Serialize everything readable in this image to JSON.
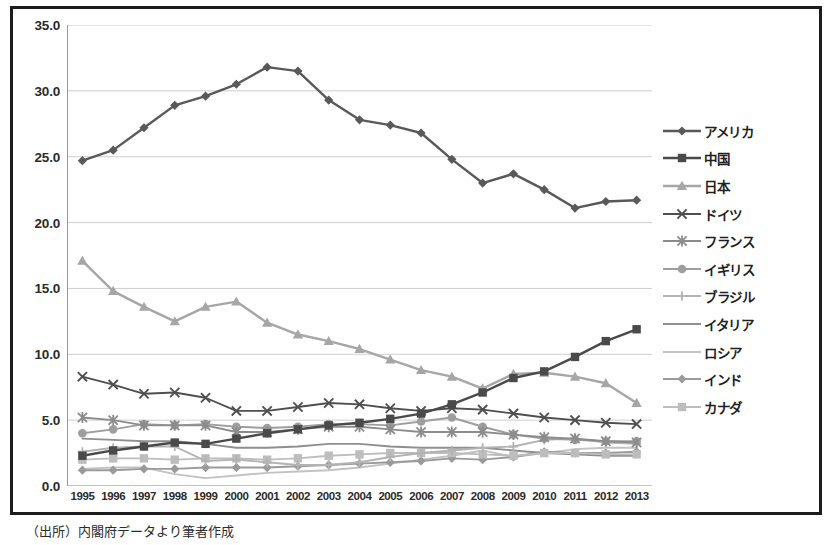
{
  "figure": {
    "source_caption": "（出所）内閣府データより筆者作成",
    "frame_color": "#1c1c1c"
  },
  "chart_data": {
    "type": "line",
    "title": "",
    "subtitle": "",
    "xlabel": "",
    "ylabel": "",
    "grid": true,
    "legend_position": "right",
    "ylim": [
      0.0,
      35.0
    ],
    "ytick_labels": [
      "35.0",
      "30.0",
      "25.0",
      "20.0",
      "15.0",
      "10.0",
      "5.0",
      "0.0"
    ],
    "yticks": [
      35.0,
      30.0,
      25.0,
      20.0,
      15.0,
      10.0,
      5.0,
      0.0
    ],
    "categories": [
      "1995",
      "1996",
      "1997",
      "1998",
      "1999",
      "2000",
      "2001",
      "2002",
      "2003",
      "2004",
      "2005",
      "2006",
      "2007",
      "2008",
      "2009",
      "2010",
      "2011",
      "2012",
      "2013"
    ],
    "series": [
      {
        "name": "アメリカ",
        "marker": "diamond",
        "color": "#595959",
        "values": [
          24.7,
          25.5,
          27.2,
          28.9,
          29.6,
          30.5,
          31.8,
          31.5,
          29.3,
          27.8,
          27.4,
          26.8,
          24.8,
          23.0,
          23.7,
          22.5,
          21.1,
          21.6,
          21.7
        ]
      },
      {
        "name": "中国",
        "marker": "square",
        "color": "#4a4a4a",
        "values": [
          2.3,
          2.7,
          3.0,
          3.3,
          3.2,
          3.6,
          4.0,
          4.3,
          4.6,
          4.8,
          5.1,
          5.5,
          6.2,
          7.1,
          8.2,
          8.7,
          9.8,
          11.0,
          11.9
        ]
      },
      {
        "name": "日本",
        "marker": "triangle",
        "color": "#a6a6a6",
        "values": [
          17.1,
          14.8,
          13.6,
          12.5,
          13.6,
          14.0,
          12.4,
          11.5,
          11.0,
          10.4,
          9.6,
          8.8,
          8.3,
          7.4,
          8.5,
          8.6,
          8.3,
          7.8,
          6.3
        ]
      },
      {
        "name": "ドイツ",
        "marker": "x",
        "color": "#4f4f4f",
        "values": [
          8.3,
          7.7,
          7.0,
          7.1,
          6.7,
          5.7,
          5.7,
          6.0,
          6.3,
          6.2,
          5.9,
          5.7,
          5.9,
          5.8,
          5.5,
          5.2,
          5.0,
          4.8,
          4.7
        ]
      },
      {
        "name": "フランス",
        "marker": "asterisk",
        "color": "#8c8c8c",
        "values": [
          5.2,
          5.0,
          4.6,
          4.6,
          4.6,
          4.1,
          4.1,
          4.3,
          4.5,
          4.5,
          4.3,
          4.1,
          4.1,
          4.1,
          3.9,
          3.7,
          3.6,
          3.4,
          3.3
        ]
      },
      {
        "name": "イギリス",
        "marker": "circle",
        "color": "#9e9e9e",
        "values": [
          4.0,
          4.3,
          4.7,
          4.6,
          4.7,
          4.5,
          4.4,
          4.5,
          4.7,
          4.7,
          4.6,
          4.9,
          5.2,
          4.5,
          3.9,
          3.6,
          3.5,
          3.4,
          3.4
        ]
      },
      {
        "name": "ブラジル",
        "marker": "plus",
        "color": "#b3b3b3",
        "values": [
          2.6,
          2.9,
          3.0,
          3.0,
          1.9,
          2.0,
          1.8,
          1.6,
          1.6,
          1.8,
          2.2,
          2.5,
          2.7,
          2.9,
          3.0,
          3.5,
          3.6,
          3.3,
          3.2
        ]
      },
      {
        "name": "イタリア",
        "marker": "none",
        "color": "#8f8f8f",
        "values": [
          3.6,
          3.5,
          3.4,
          3.4,
          3.2,
          2.9,
          2.9,
          3.0,
          3.2,
          3.2,
          3.0,
          2.9,
          2.9,
          2.9,
          2.7,
          2.5,
          2.4,
          2.3,
          2.3
        ]
      },
      {
        "name": "ロシア",
        "marker": "none",
        "color": "#c2c2c2",
        "values": [
          1.3,
          1.4,
          1.4,
          0.9,
          0.6,
          0.8,
          1.0,
          1.1,
          1.2,
          1.4,
          1.7,
          2.0,
          2.3,
          2.7,
          2.2,
          2.5,
          2.8,
          2.9,
          2.9
        ]
      },
      {
        "name": "インド",
        "marker": "diamond",
        "color": "#9a9a9a",
        "values": [
          1.2,
          1.2,
          1.3,
          1.3,
          1.4,
          1.4,
          1.4,
          1.5,
          1.6,
          1.7,
          1.8,
          1.9,
          2.1,
          2.0,
          2.2,
          2.6,
          2.5,
          2.5,
          2.6
        ]
      },
      {
        "name": "カナダ",
        "marker": "square",
        "color": "#bdbdbd",
        "values": [
          2.0,
          2.1,
          2.1,
          2.0,
          2.1,
          2.1,
          2.0,
          2.1,
          2.3,
          2.4,
          2.5,
          2.5,
          2.5,
          2.4,
          2.3,
          2.5,
          2.5,
          2.4,
          2.4
        ]
      }
    ]
  }
}
